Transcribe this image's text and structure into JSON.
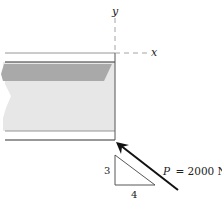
{
  "diagram": {
    "axes": {
      "x_label": "x",
      "y_label": "y"
    },
    "force": {
      "label": "P = 2000 N",
      "symbol": "P",
      "value_text": "= 2000 N",
      "magnitude": 2000,
      "unit": "N"
    },
    "slope_triangle": {
      "vertical": "3",
      "horizontal": "4"
    },
    "colors": {
      "beam_light": "#e6e6e6",
      "beam_dark": "#a8a8a8",
      "line": "#333333",
      "axis_dash": "#9a9a9a",
      "arrow": "#111111"
    }
  }
}
